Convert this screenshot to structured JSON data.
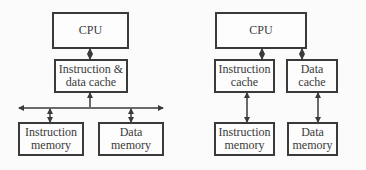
{
  "left_diagram": {
    "cpu": "CPU",
    "cache": "Instruction &\ndata cache",
    "instruction_memory": "Instruction\nmemory",
    "data_memory": "Data\nmemory"
  },
  "right_diagram": {
    "cpu": "CPU",
    "instruction_cache": "Instruction\ncache",
    "data_cache": "Data\ncache",
    "instruction_memory": "Instruction\nmemory",
    "data_memory": "Data\nmemory"
  },
  "colors": {
    "line": "#3a3a3a",
    "background": "#fbfbfb"
  }
}
